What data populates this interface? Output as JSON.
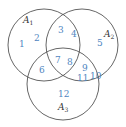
{
  "diagram": {
    "type": "venn",
    "sets": [
      {
        "label": "A",
        "subscript": "1",
        "cx": 44,
        "cy": 45,
        "r": 36,
        "label_x": 23,
        "label_y": 23
      },
      {
        "label": "A",
        "subscript": "2",
        "cx": 82,
        "cy": 45,
        "r": 36,
        "label_x": 104,
        "label_y": 37
      },
      {
        "label": "A",
        "subscript": "3",
        "cx": 63,
        "cy": 84,
        "r": 36,
        "label_x": 58,
        "label_y": 110
      }
    ],
    "regions": [
      {
        "value": "1",
        "x": 19,
        "y": 47,
        "membership": "A1 only"
      },
      {
        "value": "2",
        "x": 34,
        "y": 41,
        "membership": "A1 only"
      },
      {
        "value": "3",
        "x": 58,
        "y": 33,
        "membership": "A1 ∩ A2 only"
      },
      {
        "value": "4",
        "x": 71,
        "y": 37,
        "membership": "A1 ∩ A2 only"
      },
      {
        "value": "5",
        "x": 97,
        "y": 46,
        "membership": "A2 only"
      },
      {
        "value": "6",
        "x": 39,
        "y": 73,
        "membership": "A1 ∩ A3 only"
      },
      {
        "value": "7",
        "x": 55,
        "y": 63,
        "membership": "A1 ∩ A2 ∩ A3"
      },
      {
        "value": "8",
        "x": 67,
        "y": 65,
        "membership": "A1 ∩ A2 ∩ A3"
      },
      {
        "value": "9",
        "x": 82,
        "y": 71,
        "membership": "A2 ∩ A3 only"
      },
      {
        "value": "11",
        "x": 78,
        "y": 81,
        "membership": "A2 ∩ A3 only"
      },
      {
        "value": "10",
        "x": 90,
        "y": 79,
        "membership": "A2 ∩ A3 only"
      },
      {
        "value": "12",
        "x": 58,
        "y": 97,
        "membership": "A3 only"
      }
    ],
    "colors": {
      "numbers": "#4f86bf",
      "labels": "#333333",
      "outline": "#555555"
    }
  }
}
